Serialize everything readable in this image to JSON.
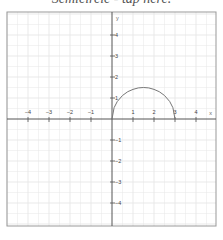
{
  "title": "Semicircle - tap here.",
  "chart_data": {
    "type": "line",
    "title": "Semicircle - tap here.",
    "xlabel": "x",
    "ylabel": "y",
    "xlim": [
      -5,
      4.9
    ],
    "ylim": [
      -5.1,
      5
    ],
    "grid": true,
    "minor_grid_step": 0.5,
    "x_ticks": [
      -4,
      -3,
      -2,
      -1,
      1,
      2,
      3,
      4
    ],
    "y_ticks": [
      -4,
      -3,
      -2,
      -1,
      1,
      2,
      3,
      4
    ],
    "series": [
      {
        "name": "semicircle",
        "description": "upper semicircle centered (1.5, 0), radius 1.5",
        "x": [
          0,
          0.1,
          0.25,
          0.5,
          0.75,
          1,
          1.25,
          1.5,
          1.75,
          2,
          2.25,
          2.5,
          2.75,
          2.9,
          3
        ],
        "y": [
          0,
          0.54,
          0.83,
          1.12,
          1.3,
          1.41,
          1.48,
          1.5,
          1.48,
          1.41,
          1.3,
          1.12,
          0.83,
          0.54,
          0
        ]
      }
    ]
  },
  "colors": {
    "axis": "#555555",
    "grid": "#e6e6e6",
    "frame": "#999999",
    "curve": "#777777"
  }
}
